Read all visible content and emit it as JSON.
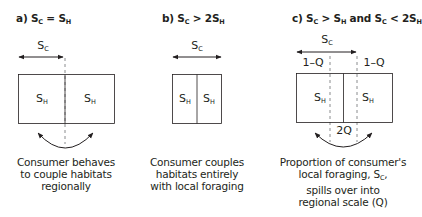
{
  "panels": [
    {
      "id": "a",
      "title": {
        "prefix": "a) S",
        "sub1": "C",
        "mid": " = S",
        "sub2": "H",
        "mid2": "",
        "sub3": "",
        "mid3": "",
        "sub4": ""
      },
      "range_label": {
        "main": "S",
        "sub": "C"
      },
      "habitats": [
        {
          "main": "S",
          "sub": "H"
        },
        {
          "main": "S",
          "sub": "H"
        }
      ],
      "caption": [
        "Consumer behaves",
        "to couple habitats",
        "regionally"
      ]
    },
    {
      "id": "b",
      "title": {
        "prefix": "b) S",
        "sub1": "C",
        "mid": " > 2S",
        "sub2": "H",
        "mid2": "",
        "sub3": "",
        "mid3": "",
        "sub4": ""
      },
      "range_label": {
        "main": "S",
        "sub": "C"
      },
      "habitats": [
        {
          "main": "S",
          "sub": "H"
        },
        {
          "main": "S",
          "sub": "H"
        }
      ],
      "caption": [
        "Consumer couples",
        "habitats entirely",
        "with local foraging"
      ]
    },
    {
      "id": "c",
      "title": {
        "prefix": "c) S",
        "sub1": "C",
        "mid": " > S",
        "sub2": "H",
        "mid2": " and  S",
        "sub3": "C",
        "mid3": " < 2S",
        "sub4": "H"
      },
      "range_label": {
        "main": "S",
        "sub": "C"
      },
      "habitats": [
        {
          "main": "S",
          "sub": "H"
        },
        {
          "main": "S",
          "sub": "H"
        }
      ],
      "q_labels": {
        "left": "1–Q",
        "right": "1–Q",
        "center": "2Q"
      },
      "caption": [
        "Proportion of consumer's",
        "local foraging, S",
        "spills over into",
        "regional scale (Q)"
      ],
      "caption_sub": {
        "main": "C",
        "suffix": ","
      }
    }
  ],
  "colors": {
    "stroke": "#231f20",
    "dash": "#6d6e71",
    "text": "#231f20",
    "background": "#ffffff"
  }
}
